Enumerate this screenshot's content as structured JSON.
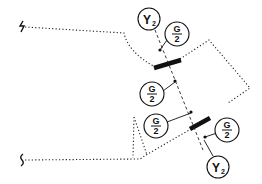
{
  "diagram": {
    "labels": {
      "y2_top": {
        "main": "Y",
        "sub": "2"
      },
      "g2_top": {
        "num": "G",
        "den": "2"
      },
      "g2_mid": {
        "num": "G",
        "den": "2"
      },
      "g2_lower_left": {
        "num": "G",
        "den": "2"
      },
      "g2_lower_right": {
        "num": "G",
        "den": "2"
      },
      "y2_bottom": {
        "main": "Y",
        "sub": "2"
      }
    },
    "colors": {
      "line": "#111111",
      "background": "#ffffff"
    }
  }
}
